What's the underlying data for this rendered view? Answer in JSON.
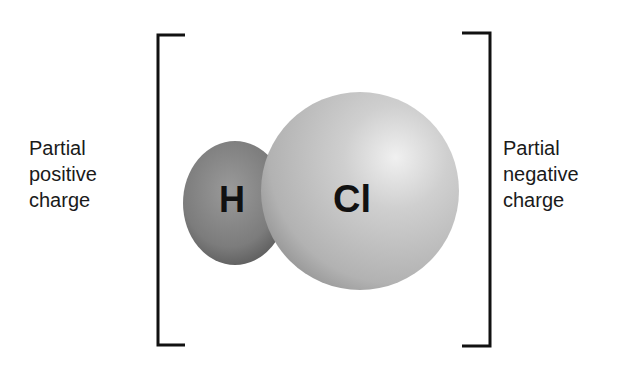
{
  "left_label": {
    "line1": "Partial",
    "line2": "positive",
    "line3": "charge"
  },
  "right_label": {
    "line1": "Partial",
    "line2": "negative",
    "line3": "charge"
  },
  "atoms": {
    "hydrogen": {
      "symbol": "H",
      "color": "#7a7a7a"
    },
    "chlorine": {
      "symbol": "Cl",
      "color": "#c4c4c4"
    }
  },
  "bracket_color": "#111111"
}
